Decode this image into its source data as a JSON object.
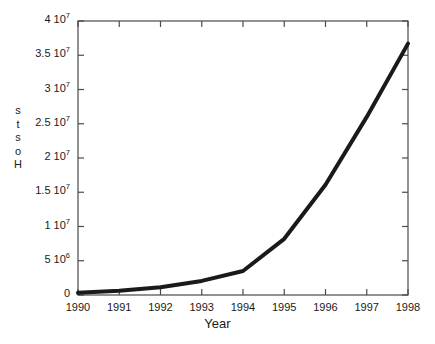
{
  "chart_data": {
    "type": "line",
    "title": "",
    "xlabel": "Year",
    "ylabel": "Hosts",
    "ylabel_chars": [
      "H",
      "o",
      "s",
      "t",
      "s"
    ],
    "x": [
      1990,
      1991,
      1992,
      1993,
      1994,
      1995,
      1996,
      1997,
      1998
    ],
    "values": [
      313000,
      617000,
      1136000,
      2056000,
      3500000,
      8200000,
      16100000,
      26000000,
      36700000
    ],
    "series": [
      {
        "name": "Hosts",
        "values": [
          313000,
          617000,
          1136000,
          2056000,
          3500000,
          8200000,
          16100000,
          26000000,
          36700000
        ]
      }
    ],
    "categories": [
      "1990",
      "1991",
      "1992",
      "1993",
      "1994",
      "1995",
      "1996",
      "1997",
      "1998"
    ],
    "xlim": [
      1990,
      1998
    ],
    "ylim": [
      0,
      40000000
    ],
    "grid": false,
    "legend": false,
    "legend_position": "none",
    "line_color": "#1a1a1a",
    "line_width": 4,
    "frame": true,
    "tick_direction": "in",
    "xticks": [
      1990,
      1991,
      1992,
      1993,
      1994,
      1995,
      1996,
      1997,
      1998
    ],
    "xtick_labels": [
      "1990",
      "1991",
      "1992",
      "1993",
      "1994",
      "1995",
      "1996",
      "1997",
      "1998"
    ],
    "yticks": [
      0,
      5000000,
      10000000,
      15000000,
      20000000,
      25000000,
      30000000,
      35000000,
      40000000
    ],
    "ytick_labels": [
      {
        "mantissa": "0",
        "exponent": ""
      },
      {
        "mantissa": "5 10",
        "exponent": "6"
      },
      {
        "mantissa": "1 10",
        "exponent": "7"
      },
      {
        "mantissa": "1.5 10",
        "exponent": "7"
      },
      {
        "mantissa": "2 10",
        "exponent": "7"
      },
      {
        "mantissa": "2.5 10",
        "exponent": "7"
      },
      {
        "mantissa": "3 10",
        "exponent": "7"
      },
      {
        "mantissa": "3.5 10",
        "exponent": "7"
      },
      {
        "mantissa": "4 10",
        "exponent": "7"
      }
    ]
  },
  "colors": {
    "background": "#ffffff",
    "axis": "#4a4a4a",
    "line": "#1a1a1a",
    "text": "#1a1a1a"
  }
}
